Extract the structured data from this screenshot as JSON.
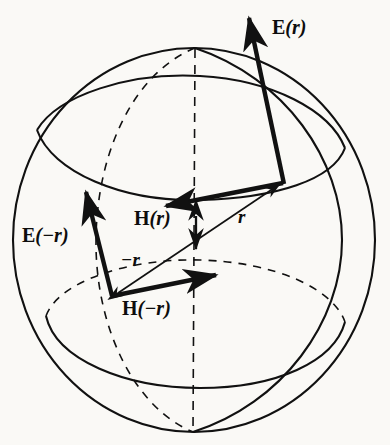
{
  "figure": {
    "background_color": "#faf9f6",
    "ink_color": "#111111",
    "canvas": {
      "width": 390,
      "height": 445
    }
  },
  "sphere": {
    "name": "sphere-outline",
    "center": {
      "x": 194,
      "y": 240
    },
    "radius_x": 181,
    "radius_y": 192,
    "style": "solid",
    "polar_axis": {
      "name": "polar-axis",
      "style": "dashed",
      "top": {
        "x": 195,
        "y": 48
      },
      "bottom": {
        "x": 193,
        "y": 432
      }
    },
    "meridian_front": {
      "name": "meridian-front",
      "style": "solid"
    },
    "meridian_back": {
      "name": "meridian-back",
      "style": "dashed"
    },
    "latitude_upper": {
      "name": "latitude-upper",
      "front_style": "solid",
      "back_style": "solid",
      "center_y": 152
    },
    "latitude_lower": {
      "name": "latitude-lower",
      "front_style": "solid",
      "back_style": "dashed",
      "center_y": 322
    }
  },
  "vectors": [
    {
      "id": "r-vector",
      "label": "r",
      "label_text": "r",
      "description": "position vector from sphere centre region to upper-right surface point",
      "from": {
        "x": 116,
        "y": 294
      },
      "to": {
        "x": 283,
        "y": 182
      },
      "head": "single",
      "weight": "thin"
    },
    {
      "id": "minus-r-vector",
      "label": "-r",
      "label_text": "−r",
      "description": "position vector pointing to the lower-left surface point",
      "from": {
        "x": 283,
        "y": 182
      },
      "to": {
        "x": 116,
        "y": 294
      },
      "head": "single",
      "weight": "thin"
    },
    {
      "id": "E-r-vector",
      "label": "E(r)",
      "label_text": "E(r)",
      "description": "electric field vector at point r, pointing up and slightly left",
      "from": {
        "x": 283,
        "y": 182
      },
      "to": {
        "x": 248,
        "y": 14
      },
      "head": "single",
      "weight": "thick"
    },
    {
      "id": "H-r-vector",
      "label": "H(r)",
      "label_text": "H(r)",
      "description": "magnetic field vector at point r, pointing left and slightly down",
      "from": {
        "x": 283,
        "y": 182
      },
      "to": {
        "x": 163,
        "y": 207
      },
      "head": "single",
      "weight": "thick"
    },
    {
      "id": "E-minus-r-vector",
      "label": "E(-r)",
      "label_text": "E(−r)",
      "description": "electric field vector at point -r, pointing up and slightly left",
      "from": {
        "x": 112,
        "y": 296
      },
      "to": {
        "x": 85,
        "y": 188
      },
      "head": "single",
      "weight": "thick"
    },
    {
      "id": "H-minus-r-vector",
      "label": "H(-r)",
      "label_text": "H(−r)",
      "description": "magnetic field vector at point -r, pointing right and slightly up",
      "from": {
        "x": 112,
        "y": 296
      },
      "to": {
        "x": 220,
        "y": 274
      },
      "head": "single",
      "weight": "thick"
    },
    {
      "id": "double-arrow-center",
      "label": "",
      "label_text": "",
      "description": "short vertical double-headed arrow marking the sphere centre",
      "from": {
        "x": 196,
        "y": 212
      },
      "to": {
        "x": 196,
        "y": 253
      },
      "head": "double",
      "weight": "thin"
    }
  ],
  "labels": {
    "E_r": {
      "vec": "E",
      "arg": "(r)"
    },
    "H_r": {
      "vec": "H",
      "arg": "(r)"
    },
    "E_minus_r": {
      "vec": "E",
      "arg": "(−r)"
    },
    "H_minus_r": {
      "vec": "H",
      "arg": "(−r)"
    },
    "r": "r",
    "minus_r": "−r"
  }
}
